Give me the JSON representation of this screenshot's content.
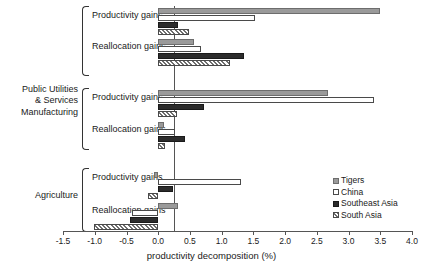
{
  "chart_data": {
    "type": "bar",
    "orientation": "horizontal",
    "title": "",
    "xlabel": "productivity decomposition (%)",
    "ylabel": "",
    "xlim": [
      -1.5,
      4.0
    ],
    "xticks": [
      -1.5,
      -1.0,
      -0.5,
      0.0,
      0.5,
      1.0,
      1.5,
      2.0,
      2.5,
      3.0,
      3.5,
      4.0
    ],
    "xticklabels": [
      "-1.5",
      "-1.0",
      "-0.5",
      "0.0",
      "0.5",
      "1.0",
      "1.5",
      "2.0",
      "2.5",
      "3.0",
      "3.5",
      "4.0"
    ],
    "grid": false,
    "legend_position": "right-middle",
    "legend": [
      "Tigers",
      "China",
      "Southeast Asia",
      "South Asia"
    ],
    "series_styles": [
      "solid-gray",
      "white-outline",
      "solid-black",
      "hatched"
    ],
    "sectors": [
      "Public Utilities & Services",
      "Manufacturing",
      "Agriculture"
    ],
    "components": [
      "Productivity gains",
      "Reallocation gains"
    ],
    "groups": [
      {
        "sector": "Public Utilities & Services",
        "component": "Productivity gains",
        "values": {
          "Tigers": 3.5,
          "China": 1.52,
          "Southeast Asia": 0.32,
          "South Asia": 0.49
        }
      },
      {
        "sector": "Public Utilities & Services",
        "component": "Reallocation gains",
        "values": {
          "Tigers": 0.56,
          "China": 0.67,
          "Southeast Asia": 1.35,
          "South Asia": 1.13
        }
      },
      {
        "sector": "Manufacturing",
        "component": "Productivity gains",
        "values": {
          "Tigers": 2.68,
          "China": 3.4,
          "Southeast Asia": 0.72,
          "South Asia": 0.3
        }
      },
      {
        "sector": "Manufacturing",
        "component": "Reallocation gains",
        "values": {
          "Tigers": 0.09,
          "China": 0.27,
          "Southeast Asia": 0.43,
          "South Asia": 0.11
        }
      },
      {
        "sector": "Agriculture",
        "component": "Productivity gains",
        "values": {
          "Tigers": -0.07,
          "China": 1.3,
          "Southeast Asia": 0.24,
          "South Asia": -0.16
        }
      },
      {
        "sector": "Agriculture",
        "component": "Reallocation gains",
        "values": {
          "Tigers": 0.32,
          "China": -0.42,
          "Southeast Asia": -0.45,
          "South Asia": -1.02
        }
      }
    ]
  },
  "labels": {
    "sector_0": "Public Utilities",
    "sector_0_line2": "& Services",
    "sector_1": "Manufacturing",
    "sector_2": "Agriculture",
    "comp_prod": "Productivity gains",
    "comp_realloc": "Reallocation gains"
  },
  "axis": {
    "xlabel": "productivity decomposition (%)",
    "t0": "-1.5",
    "t1": "-1.0",
    "t2": "-0.5",
    "t3": "0.0",
    "t4": "0.5",
    "t5": "1.0",
    "t6": "1.5",
    "t7": "2.0",
    "t8": "2.5",
    "t9": "3.0",
    "t10": "3.5",
    "t11": "4.0"
  },
  "legend": {
    "items": [
      {
        "label": "Tigers",
        "color": "#9a9a9a"
      },
      {
        "label": "China",
        "color": "#ffffff"
      },
      {
        "label": "Southeast Asia",
        "color": "#2c2c2c"
      },
      {
        "label": "South Asia",
        "color": "#8a8a8a"
      }
    ]
  }
}
